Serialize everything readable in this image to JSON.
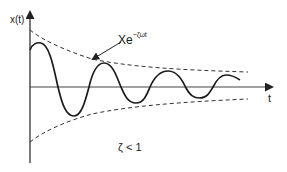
{
  "diagram": {
    "y_axis_label": "x(t)",
    "x_axis_label": "t",
    "envelope_label_base": "Xe",
    "envelope_label_exponent": "−ζωt",
    "condition_label": "ζ < 1",
    "colors": {
      "curve": "#1a1a1a",
      "envelope": "#333333",
      "axes": "#333333",
      "background": "#ffffff"
    },
    "elements": [
      {
        "name": "damped-oscillation-curve",
        "style": "solid"
      },
      {
        "name": "upper-envelope",
        "style": "dashed",
        "formula": "Xe^(−ζωt)"
      },
      {
        "name": "lower-envelope",
        "style": "dashed",
        "formula": "−Xe^(−ζωt)"
      },
      {
        "name": "annotation-arrow",
        "points_to": "upper-envelope"
      }
    ]
  }
}
